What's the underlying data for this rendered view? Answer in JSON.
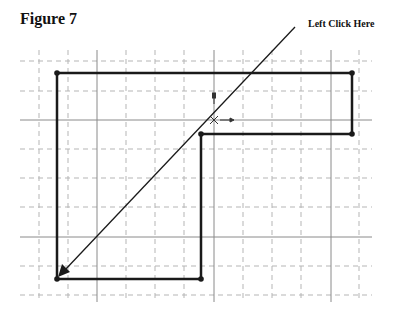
{
  "figure": {
    "title": "Figure 7",
    "callout_label": "Left Click Here"
  },
  "colors": {
    "outline": "#1a1a1a",
    "grid_solid": "#8a8a8a",
    "grid_dashed": "#b5b5b5",
    "background": "#ffffff"
  },
  "grid": {
    "spacing_px": 29,
    "vertical_dashed_x": [
      39,
      68,
      126,
      155,
      184,
      243,
      272,
      301,
      359
    ],
    "vertical_solid_x": [
      97,
      214,
      331
    ],
    "horizontal_dashed_y": [
      61,
      91,
      149,
      178,
      207,
      266,
      295
    ],
    "horizontal_solid_y": [
      120,
      237
    ]
  },
  "shape": {
    "type": "L-shaped polygon",
    "vertices": [
      [
        57,
        73
      ],
      [
        352,
        73
      ],
      [
        352,
        134
      ],
      [
        201,
        134
      ],
      [
        201,
        279
      ],
      [
        57,
        279
      ]
    ]
  },
  "arrow": {
    "from": [
      295,
      27
    ],
    "to": [
      60,
      275
    ]
  },
  "cursor": {
    "position": [
      214,
      120
    ]
  }
}
